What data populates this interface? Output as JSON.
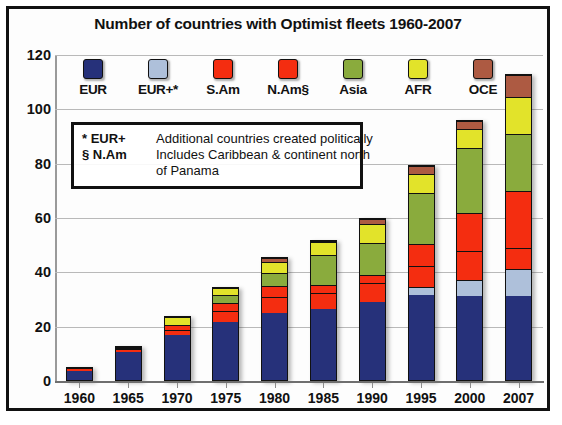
{
  "chart_data": {
    "type": "bar",
    "stacked": true,
    "title": "Number of countries with Optimist fleets 1960-2007",
    "xlabel": "",
    "ylabel": "",
    "ylim": [
      0,
      120
    ],
    "ytick_step": 20,
    "yticks": [
      "120",
      "100",
      "80",
      "60",
      "40",
      "20",
      "0"
    ],
    "grid": true,
    "legend_position": "top-inside",
    "categories": [
      "1960",
      "1965",
      "1970",
      "1975",
      "1980",
      "1985",
      "1990",
      "1995",
      "2000",
      "2007"
    ],
    "series": [
      {
        "name": "EUR",
        "color": "#26317a",
        "values": [
          4,
          11,
          17,
          22,
          25,
          26.5,
          29,
          31.5,
          31,
          31
        ]
      },
      {
        "name": "EUR+*",
        "color": "#aec0da",
        "values": [
          0,
          0,
          0,
          0,
          0,
          0,
          0,
          3,
          6,
          10
        ]
      },
      {
        "name": "S.Am",
        "color": "#f42d10",
        "values": [
          1,
          1,
          2,
          4,
          6,
          6,
          7,
          8,
          11,
          8
        ]
      },
      {
        "name": "N.Am§",
        "color": "#f42d10",
        "values": [
          0,
          0.5,
          2,
          3,
          4,
          3,
          3,
          8,
          14,
          21
        ]
      },
      {
        "name": "Asia",
        "color": "#8aab3d",
        "values": [
          0,
          0.5,
          0,
          3,
          5,
          11,
          12,
          19,
          24,
          21
        ]
      },
      {
        "name": "AFR",
        "color": "#e2e32a",
        "values": [
          0,
          0,
          3,
          2.5,
          4,
          5,
          7,
          7,
          7,
          14
        ]
      },
      {
        "name": "OCE",
        "color": "#ad5a42",
        "values": [
          0,
          0,
          0,
          0,
          1.5,
          0.5,
          2,
          3,
          3,
          8
        ]
      }
    ],
    "totals": [
      5,
      13,
      24,
      34.5,
      45.5,
      52,
      60,
      80,
      96,
      113
    ]
  },
  "legend": {
    "items": [
      {
        "label": "EUR",
        "color": "#26317a",
        "swatch_name": "legend-swatch-eur"
      },
      {
        "label": "EUR+*",
        "color": "#aec0da",
        "swatch_name": "legend-swatch-eurplus"
      },
      {
        "label": "S.Am",
        "color": "#f42d10",
        "swatch_name": "legend-swatch-sam"
      },
      {
        "label": "N.Am§",
        "color": "#f42d10",
        "swatch_name": "legend-swatch-nam"
      },
      {
        "label": "Asia",
        "color": "#8aab3d",
        "swatch_name": "legend-swatch-asia"
      },
      {
        "label": "AFR",
        "color": "#e2e32a",
        "swatch_name": "legend-swatch-afr"
      },
      {
        "label": "OCE",
        "color": "#ad5a42",
        "swatch_name": "legend-swatch-oce"
      }
    ]
  },
  "note_box": {
    "row1_key": "* EUR+",
    "row1_text": "Additional countries created politically",
    "row2_key": "§ N.Am",
    "row2_text": "Includes Caribbean & continent north",
    "row2_cont": "of Panama"
  }
}
